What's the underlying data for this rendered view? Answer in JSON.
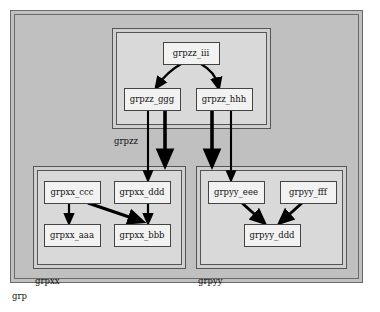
{
  "graph": {
    "label": "grp",
    "label_position": "bottom-left-outside",
    "background": "#c0c0c0",
    "border_color": "#555555",
    "node_fill": "#f2f2f2",
    "node_border": "#444444",
    "cluster_fill": "#cfcfcf",
    "cluster_border": "#555555",
    "edge_color": "#000000"
  },
  "clusters": [
    {
      "id": "cluster_grpzz",
      "label": "grpzz",
      "x": 112,
      "y": 28,
      "w": 158,
      "h": 100,
      "label_x": 114,
      "label_y": 137,
      "nodes": [
        {
          "id": "grpzz_iii",
          "label": "grpzz_iii",
          "x": 163,
          "y": 42,
          "w": 56,
          "h": 22
        },
        {
          "id": "grpzz_ggg",
          "label": "grpzz_ggg",
          "x": 124,
          "y": 88,
          "w": 56,
          "h": 22
        },
        {
          "id": "grpzz_hhh",
          "label": "grpzz_hhh",
          "x": 196,
          "y": 88,
          "w": 56,
          "h": 22
        }
      ]
    },
    {
      "id": "cluster_grpxx",
      "label": "grpxx",
      "x": 33,
      "y": 166,
      "w": 152,
      "h": 102,
      "label_x": 35,
      "label_y": 277,
      "nodes": [
        {
          "id": "grpxx_ccc",
          "label": "grpxx_ccc",
          "x": 44,
          "y": 181,
          "w": 56,
          "h": 22
        },
        {
          "id": "grpxx_ddd",
          "label": "grpxx_ddd",
          "x": 114,
          "y": 181,
          "w": 56,
          "h": 22
        },
        {
          "id": "grpxx_aaa",
          "label": "grpxx_aaa",
          "x": 44,
          "y": 224,
          "w": 56,
          "h": 22
        },
        {
          "id": "grpxx_bbb",
          "label": "grpxx_bbb",
          "x": 114,
          "y": 224,
          "w": 56,
          "h": 22
        }
      ]
    },
    {
      "id": "cluster_grpyy",
      "label": "grpyy",
      "x": 196,
      "y": 166,
      "w": 150,
      "h": 102,
      "label_x": 198,
      "label_y": 277,
      "nodes": [
        {
          "id": "grpyy_eee",
          "label": "grpyy_eee",
          "x": 208,
          "y": 181,
          "w": 56,
          "h": 22
        },
        {
          "id": "grpyy_fff",
          "label": "grpyy_fff",
          "x": 280,
          "y": 181,
          "w": 56,
          "h": 22
        },
        {
          "id": "grpyy_ddd",
          "label": "grpyy_ddd",
          "x": 244,
          "y": 224,
          "w": 56,
          "h": 22
        }
      ]
    }
  ],
  "edges": [
    {
      "id": "e1",
      "from": "grpzz_iii",
      "to": "grpzz_ggg",
      "kind": "node-to-node",
      "weight": "thin"
    },
    {
      "id": "e2",
      "from": "grpzz_iii",
      "to": "grpzz_hhh",
      "kind": "node-to-node",
      "weight": "thin"
    },
    {
      "id": "e3",
      "from": "grpzz_ggg",
      "to": "grpxx_ddd",
      "kind": "node-to-node",
      "weight": "thin"
    },
    {
      "id": "e4",
      "from": "grpzz_ggg",
      "to": "cluster_grpxx",
      "kind": "node-to-cluster",
      "weight": "thick"
    },
    {
      "id": "e5",
      "from": "grpzz_hhh",
      "to": "cluster_grpyy",
      "kind": "node-to-cluster",
      "weight": "thick"
    },
    {
      "id": "e6",
      "from": "grpzz_hhh",
      "to": "grpyy_eee",
      "kind": "node-to-node",
      "weight": "thin"
    },
    {
      "id": "e7",
      "from": "grpxx_ccc",
      "to": "grpxx_aaa",
      "kind": "node-to-node",
      "weight": "thin"
    },
    {
      "id": "e8",
      "from": "grpxx_ccc",
      "to": "grpxx_bbb",
      "kind": "node-to-node",
      "weight": "thick"
    },
    {
      "id": "e9",
      "from": "grpxx_ddd",
      "to": "grpxx_bbb",
      "kind": "node-to-node",
      "weight": "thin"
    },
    {
      "id": "e10",
      "from": "grpyy_eee",
      "to": "grpyy_ddd",
      "kind": "node-to-node",
      "weight": "thick"
    },
    {
      "id": "e11",
      "from": "grpyy_fff",
      "to": "grpyy_ddd",
      "kind": "node-to-node",
      "weight": "thick"
    }
  ]
}
